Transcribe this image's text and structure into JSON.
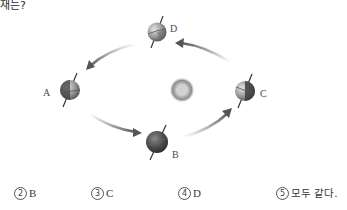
{
  "question": {
    "tail_text": "재는?"
  },
  "diagram": {
    "type": "earth-orbit-around-sun",
    "sun": {
      "cx": 182,
      "cy": 90,
      "r": 11
    },
    "globes": [
      {
        "id": "D",
        "label": "D",
        "cx": 157,
        "cy": 32,
        "label_x": 170,
        "label_y": 24
      },
      {
        "id": "A",
        "label": "A",
        "cx": 70,
        "cy": 90,
        "label_x": 43,
        "label_y": 88
      },
      {
        "id": "B",
        "label": "B",
        "cx": 157,
        "cy": 142,
        "label_x": 172,
        "label_y": 150
      },
      {
        "id": "C",
        "label": "C",
        "cx": 245,
        "cy": 92,
        "label_x": 260,
        "label_y": 89
      }
    ],
    "arrows": [
      {
        "from": "D",
        "to": "A"
      },
      {
        "from": "A",
        "to": "B"
      },
      {
        "from": "B",
        "to": "C"
      },
      {
        "from": "C",
        "to": "D"
      }
    ],
    "colors": {
      "arrow": "#6b6b6b",
      "globe_dark": "#3d3d3d",
      "globe_light": "#bdbdbd",
      "sun": "#9a9a9a"
    }
  },
  "options": [
    {
      "num": "2",
      "label": "B",
      "x": 14
    },
    {
      "num": "3",
      "label": "C",
      "x": 91
    },
    {
      "num": "4",
      "label": "D",
      "x": 178
    },
    {
      "num": "5",
      "label": "모두 같다.",
      "x": 276
    }
  ]
}
